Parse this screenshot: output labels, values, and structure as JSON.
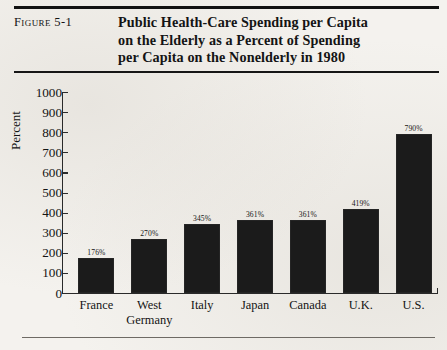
{
  "figure": {
    "label": "Figure 5-1",
    "title_lines": [
      "Public Health-Care Spending per Capita",
      "on the Elderly as a Percent of Spending",
      "per Capita on the Nonelderly in 1980"
    ]
  },
  "chart_data": {
    "type": "bar",
    "title": "Public Health-Care Spending per Capita on the Elderly as a Percent of Spending per Capita on the Nonelderly in 1980",
    "xlabel": "",
    "ylabel": "Percent",
    "ylim": [
      0,
      1000
    ],
    "yticks": [
      0,
      100,
      200,
      300,
      400,
      500,
      600,
      700,
      800,
      900,
      1000
    ],
    "ytick_labels": [
      "0",
      "100",
      "200",
      "300",
      "400",
      "500",
      "600",
      "700",
      "800",
      "900",
      "1000"
    ],
    "grid": false,
    "legend": "none",
    "categories": [
      "France",
      "West Germany",
      "Italy",
      "Japan",
      "Canada",
      "U.K.",
      "U.S."
    ],
    "category_lines": [
      [
        "France"
      ],
      [
        "West",
        "Germany"
      ],
      [
        "Italy"
      ],
      [
        "Japan"
      ],
      [
        "Canada"
      ],
      [
        "U.K."
      ],
      [
        "U.S."
      ]
    ],
    "values": [
      176,
      270,
      345,
      361,
      361,
      419,
      790
    ],
    "data_labels": [
      "176%",
      "270%",
      "345%",
      "361%",
      "361%",
      "419%",
      "790%"
    ],
    "bar_color": "#1b1b1b"
  }
}
